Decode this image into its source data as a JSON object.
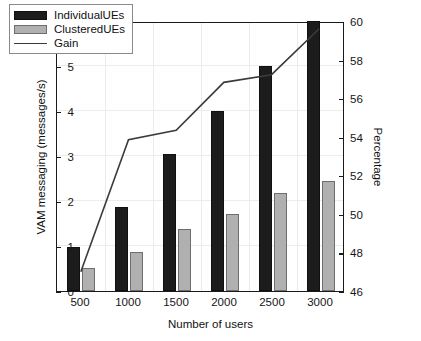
{
  "chart_data": {
    "type": "bar",
    "title": "",
    "xlabel": "Number of users",
    "ylabel": "VAM messaging (messages/s)",
    "y2label": "Percentage",
    "y_exponent_label": "× 10⁵",
    "categories": [
      "500",
      "1000",
      "1500",
      "2000",
      "2500",
      "3000"
    ],
    "ylim": [
      0,
      6
    ],
    "yticks": [
      "0",
      "1",
      "2",
      "3",
      "4",
      "5",
      "6"
    ],
    "y2lim": [
      46,
      60
    ],
    "y2ticks": [
      "46",
      "48",
      "50",
      "52",
      "54",
      "56",
      "58",
      "60"
    ],
    "grid": true,
    "legend_position": "upper-left",
    "series": [
      {
        "name": "IndividualUEs",
        "kind": "bar",
        "color": "#1c1c1c",
        "axis": "left",
        "values": [
          0.97,
          1.86,
          3.05,
          4.0,
          5.0,
          6.0
        ]
      },
      {
        "name": "ClusteredUEs",
        "kind": "bar",
        "color": "#b0b0b0",
        "axis": "left",
        "values": [
          0.52,
          0.87,
          1.38,
          1.72,
          2.17,
          2.45
        ]
      },
      {
        "name": "Gain",
        "kind": "line",
        "color": "#3b3b3b",
        "axis": "right",
        "values": [
          47.0,
          53.9,
          54.4,
          56.9,
          57.3,
          59.7
        ]
      }
    ]
  }
}
